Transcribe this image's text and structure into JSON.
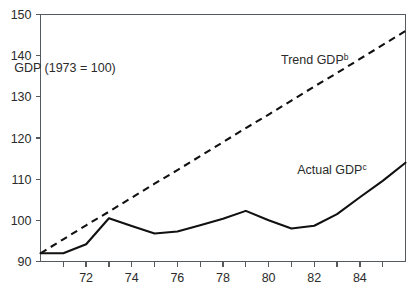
{
  "chart_data": {
    "type": "line",
    "title": "",
    "xlabel": "",
    "ylabel": "",
    "note": "GDP  (1973 = 100)",
    "xlim": [
      1970,
      1986
    ],
    "ylim": [
      90,
      150
    ],
    "grid": false,
    "legend_position": "inline-annotations",
    "y_ticks": [
      90,
      100,
      110,
      120,
      130,
      140,
      150
    ],
    "y_tick_labels": [
      "90",
      "100",
      "110",
      "120",
      "130",
      "140",
      "150"
    ],
    "x_ticks": [
      1971,
      1972,
      1973,
      1974,
      1975,
      1976,
      1977,
      1978,
      1979,
      1980,
      1981,
      1982,
      1983,
      1984,
      1985
    ],
    "x_tick_labels_major": [
      "72",
      "74",
      "76",
      "78",
      "80",
      "82",
      "84"
    ],
    "x_major_ticks": [
      1972,
      1974,
      1976,
      1978,
      1980,
      1982,
      1984
    ],
    "x": [
      1970,
      1971,
      1972,
      1973,
      1974,
      1975,
      1976,
      1977,
      1978,
      1979,
      1980,
      1981,
      1982,
      1983,
      1984,
      1985,
      1986
    ],
    "series": [
      {
        "name": "Actual GDP",
        "label": "Actual GDP",
        "label_superscript": "c",
        "style": "solid",
        "color": "#111111",
        "values": [
          92.0,
          92.0,
          94.2,
          100.5,
          98.6,
          96.8,
          97.3,
          98.8,
          100.4,
          102.3,
          100.0,
          98.0,
          98.7,
          101.5,
          105.6,
          109.6,
          114.0
        ]
      },
      {
        "name": "Trend GDP",
        "label": "Trend GDP",
        "label_superscript": "b",
        "style": "dashed",
        "color": "#111111",
        "values": [
          92.0,
          95.4,
          98.8,
          102.1,
          105.5,
          108.9,
          112.2,
          115.6,
          119.0,
          122.4,
          125.7,
          129.1,
          132.5,
          135.8,
          139.2,
          142.6,
          146.0
        ]
      }
    ],
    "annotations": [
      {
        "name": "note-label",
        "text": "GDP  (1973 = 100)",
        "x": 1973.3,
        "y": 136.0
      },
      {
        "name": "trend-label",
        "text": "Trend GDP",
        "superscript": "b",
        "x": 1983.5,
        "y": 138.0
      },
      {
        "name": "actual-label",
        "text": "Actual GDP",
        "superscript": "c",
        "x": 1984.3,
        "y": 111.3
      }
    ]
  }
}
